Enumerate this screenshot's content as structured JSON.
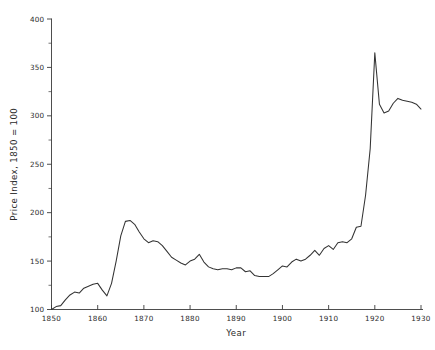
{
  "chart_data": {
    "type": "line",
    "title": "",
    "xlabel": "Year",
    "ylabel": "Price Index, 1850 = 100",
    "xlim": [
      1850,
      1930
    ],
    "ylim": [
      100,
      400
    ],
    "grid": false,
    "legend": null,
    "x_ticks": [
      1850,
      1860,
      1870,
      1880,
      1890,
      1900,
      1910,
      1920,
      1930
    ],
    "x_tick_labels": [
      "1850",
      "1860",
      "1870",
      "1880",
      "1890",
      "1900",
      "1910",
      "1920",
      "1930"
    ],
    "y_ticks": [
      100,
      150,
      200,
      250,
      300,
      350,
      400
    ],
    "y_tick_labels": [
      "100",
      "150",
      "200",
      "250",
      "300",
      "350",
      "400"
    ],
    "y_minor_ticks": [
      125,
      175,
      225,
      275,
      325,
      375
    ],
    "line_color": "#333333",
    "series": [
      {
        "name": "Price Index",
        "x": [
          1850,
          1851,
          1852,
          1853,
          1854,
          1855,
          1856,
          1857,
          1858,
          1859,
          1860,
          1861,
          1862,
          1863,
          1864,
          1865,
          1866,
          1867,
          1868,
          1869,
          1870,
          1871,
          1872,
          1873,
          1874,
          1875,
          1876,
          1877,
          1878,
          1879,
          1880,
          1881,
          1882,
          1883,
          1884,
          1885,
          1886,
          1887,
          1888,
          1889,
          1890,
          1891,
          1892,
          1893,
          1894,
          1895,
          1896,
          1897,
          1898,
          1899,
          1900,
          1901,
          1902,
          1903,
          1904,
          1905,
          1906,
          1907,
          1908,
          1909,
          1910,
          1911,
          1912,
          1913,
          1914,
          1915,
          1916,
          1917,
          1918,
          1919,
          1920,
          1921,
          1922,
          1923,
          1924,
          1925,
          1926,
          1927,
          1928,
          1929,
          1930
        ],
        "values": [
          100,
          103,
          104,
          110,
          115,
          118,
          117,
          122,
          124,
          126,
          127,
          120,
          114,
          127,
          150,
          176,
          191,
          192,
          188,
          180,
          173,
          169,
          171,
          170,
          166,
          160,
          154,
          151,
          148,
          146,
          150,
          152,
          157,
          149,
          144,
          142,
          141,
          142,
          142,
          141,
          143,
          143,
          139,
          140,
          135,
          134,
          134,
          134,
          137,
          141,
          145,
          144,
          149,
          152,
          150,
          152,
          156,
          161,
          156,
          163,
          166,
          162,
          169,
          170,
          169,
          173,
          185,
          186,
          218,
          266,
          365,
          312,
          303,
          305,
          313,
          318,
          316,
          315,
          314,
          312,
          307
        ]
      }
    ]
  }
}
